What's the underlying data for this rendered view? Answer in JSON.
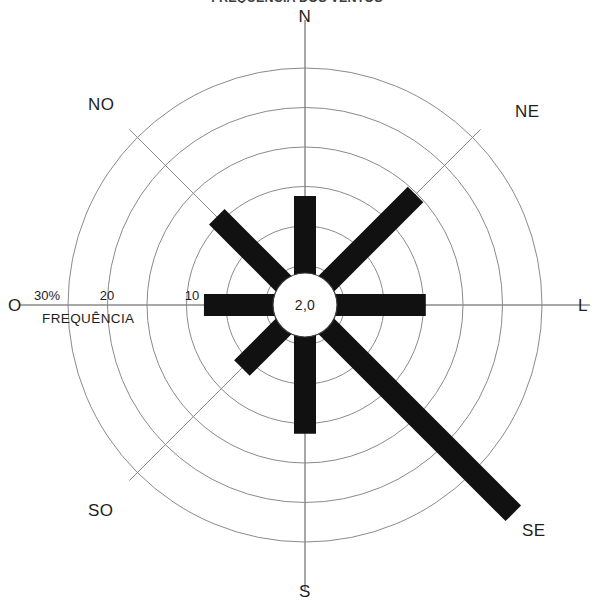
{
  "title": "FREQUÊNCIA DOS VENTOS",
  "center_label": "2,0",
  "axis": {
    "freq_label": "FREQUÊNCIA",
    "unit_tick": "30%",
    "ticks": [
      {
        "label": "30%",
        "value": 30
      },
      {
        "label": "20",
        "value": 20
      },
      {
        "label": "10",
        "value": 10
      }
    ]
  },
  "directions": {
    "n": "N",
    "ne": "NE",
    "e": "L",
    "se": "SE",
    "s": "S",
    "sw": "SO",
    "w": "O",
    "nw": "NO"
  },
  "colors": {
    "petal": "#111111",
    "grid": "#8a8a8a",
    "text": "#1e1e1e",
    "background": "#ffffff"
  },
  "chart_data": {
    "type": "bar",
    "subtype": "wind-rose",
    "title": "FREQUÊNCIA DOS VENTOS",
    "xlabel": "",
    "ylabel": "FREQUÊNCIA",
    "unit": "%",
    "rlim": [
      0,
      30
    ],
    "grid": true,
    "legend": "none",
    "calm_percent": 2.0,
    "calm_label": "2,0",
    "radial_ticks": [
      10,
      20,
      30
    ],
    "radial_tick_labels": [
      "10",
      "20",
      "30%"
    ],
    "categories": [
      "N",
      "NE",
      "L",
      "SE",
      "S",
      "SO",
      "O",
      "NO"
    ],
    "category_names": [
      "Norte",
      "Nordeste",
      "Leste",
      "Sudeste",
      "Sul",
      "Sudoeste",
      "Oeste",
      "Noroeste"
    ],
    "angles_deg": [
      0,
      45,
      90,
      135,
      180,
      225,
      270,
      315
    ],
    "values": [
      10.5,
      16.5,
      12.0,
      34.0,
      13.0,
      8.0,
      9.5,
      12.5
    ],
    "series": [
      {
        "name": "Frequência dos ventos (%)",
        "values": [
          10.5,
          16.5,
          12.0,
          34.0,
          13.0,
          8.0,
          9.5,
          12.5
        ]
      }
    ]
  }
}
